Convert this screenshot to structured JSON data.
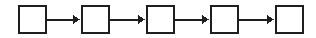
{
  "canvas": {
    "width": 316,
    "height": 38,
    "background_color": "#ffffff",
    "title": "Chain of five empty square nodes linked by right-pointing arrows"
  },
  "style": {
    "node_stroke_color": "#1f1f1f",
    "node_fill_color": "#ffffff",
    "node_stroke_width": 2,
    "connector_color": "#1f1f1f",
    "connector_stroke_width": 2,
    "arrowhead_length": 7,
    "arrowhead_half_height": 4.5
  },
  "diagram": {
    "type": "node-chain",
    "orientation": "horizontal",
    "node_count": 5,
    "connector_count": 4,
    "node_width": 29,
    "node_height": 29,
    "node_top": 5,
    "center_y": 19.5,
    "nodes": [
      {
        "id": "node-1",
        "label": "",
        "x": 18,
        "y": 5,
        "width": 29,
        "height": 29
      },
      {
        "id": "node-2",
        "label": "",
        "x": 81,
        "y": 5,
        "width": 29,
        "height": 29
      },
      {
        "id": "node-3",
        "label": "",
        "x": 146,
        "y": 5,
        "width": 29,
        "height": 29
      },
      {
        "id": "node-4",
        "label": "",
        "x": 210,
        "y": 5,
        "width": 29,
        "height": 29
      },
      {
        "id": "node-5",
        "label": "",
        "x": 275,
        "y": 5,
        "width": 29,
        "height": 29
      }
    ],
    "connectors": [
      {
        "id": "arrow-1",
        "from": "node-1",
        "to": "node-2",
        "x1": 47,
        "x2": 80,
        "y": 19.5,
        "direction": "right"
      },
      {
        "id": "arrow-2",
        "from": "node-2",
        "to": "node-3",
        "x1": 110,
        "x2": 145,
        "y": 19.5,
        "direction": "right"
      },
      {
        "id": "arrow-3",
        "from": "node-3",
        "to": "node-4",
        "x1": 175,
        "x2": 209,
        "y": 19.5,
        "direction": "right"
      },
      {
        "id": "arrow-4",
        "from": "node-4",
        "to": "node-5",
        "x1": 239,
        "x2": 274,
        "y": 19.5,
        "direction": "right"
      }
    ]
  }
}
